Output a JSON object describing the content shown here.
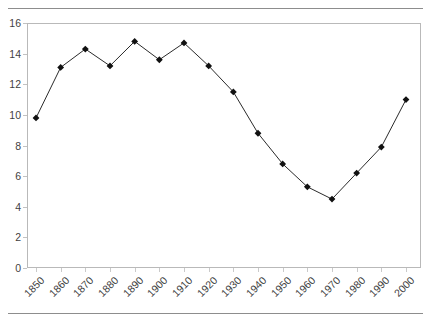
{
  "title_clipped": "",
  "chart_data": {
    "type": "line",
    "title": "",
    "xlabel": "",
    "ylabel": "",
    "categories": [
      "1850",
      "1860",
      "1870",
      "1880",
      "1890",
      "1900",
      "1910",
      "1920",
      "1930",
      "1940",
      "1950",
      "1960",
      "1970",
      "1980",
      "1990",
      "2000"
    ],
    "values": [
      9.8,
      13.1,
      14.3,
      13.2,
      14.8,
      13.6,
      14.7,
      13.2,
      11.5,
      8.8,
      6.8,
      5.3,
      4.5,
      6.2,
      7.9,
      11.0
    ],
    "ylim": [
      0,
      16
    ],
    "ytick_step": 2,
    "yticks": [
      "0",
      "2",
      "4",
      "6",
      "8",
      "10",
      "12",
      "14",
      "16"
    ],
    "grid": false,
    "legend": "none",
    "marker": "diamond",
    "line_color": "#2a2a2a",
    "marker_color": "#111111",
    "plot_border_color": "#b9b9b9",
    "rule_color": "#8d8d8d"
  }
}
